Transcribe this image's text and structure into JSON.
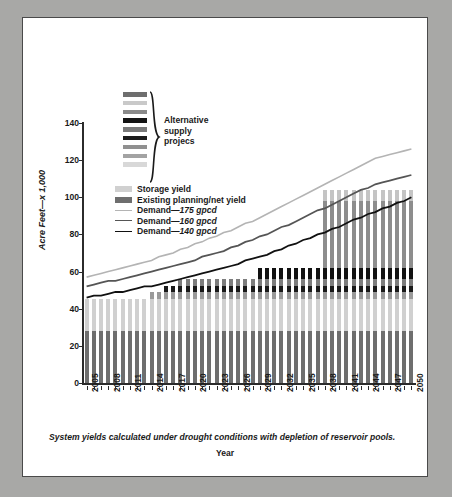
{
  "figure": {
    "label": "FIGURE 4",
    "title": "Water demand projections and alternative water supply projects",
    "footnote": "System yields calculated under drought conditions with depletion of reservoir pools."
  },
  "annotation": {
    "alt_supply_label_line1": "Alternative",
    "alt_supply_label_line2": "supply",
    "alt_supply_label_line3": "projecs",
    "swatch_colors": [
      "#6e6e6e",
      "#c9c9c9",
      "#8a8a8a",
      "#141414",
      "#7a7a7a",
      "#1c1c1c",
      "#909090",
      "#a3a3a3",
      "#d8d8d8"
    ]
  },
  "legend": {
    "position": "inside-top-left",
    "items": [
      {
        "label": "Storage yield",
        "type": "swatch",
        "color": "#d0d0d0"
      },
      {
        "label": "Existing planning/net yield",
        "type": "swatch",
        "color": "#6e6e6e"
      },
      {
        "label": "Demand—",
        "emphasis": "175 gpcd",
        "type": "line",
        "color": "#b4b4b4",
        "width": 1.6
      },
      {
        "label": "Demand—",
        "emphasis": "160 gpcd",
        "type": "line",
        "color": "#555555",
        "width": 1.8
      },
      {
        "label": "Demand—",
        "emphasis": "140 gpcd",
        "type": "line",
        "color": "#111111",
        "width": 1.8
      }
    ]
  },
  "chart_data": {
    "type": "bar",
    "stacked": true,
    "title": "Water demand projections and alternative water supply projects",
    "xlabel": "Year",
    "ylabel": "Acre Feet—x 1,000",
    "ylim": [
      0,
      140
    ],
    "yticks": [
      0,
      20,
      40,
      60,
      80,
      100,
      120,
      140
    ],
    "grid": false,
    "legend_position": "upper-left-inside",
    "x": [
      2005,
      2006,
      2007,
      2008,
      2009,
      2010,
      2011,
      2012,
      2013,
      2014,
      2015,
      2016,
      2017,
      2018,
      2019,
      2020,
      2021,
      2022,
      2023,
      2024,
      2025,
      2026,
      2027,
      2028,
      2029,
      2030,
      2031,
      2032,
      2033,
      2034,
      2035,
      2036,
      2037,
      2038,
      2039,
      2040,
      2041,
      2042,
      2043,
      2044,
      2045,
      2046,
      2047,
      2048,
      2049,
      2050
    ],
    "xtick_labels": [
      2005,
      2008,
      2011,
      2014,
      2017,
      2020,
      2023,
      2026,
      2029,
      2032,
      2035,
      2038,
      2041,
      2044,
      2047,
      2050
    ],
    "bar_series": [
      {
        "name": "Existing planning/net yield",
        "color": "#6e6e6e",
        "values": [
          28,
          28,
          28,
          28,
          28,
          28,
          28,
          28,
          28,
          28,
          28,
          28,
          28,
          28,
          28,
          28,
          28,
          28,
          28,
          28,
          28,
          28,
          28,
          28,
          28,
          28,
          28,
          28,
          28,
          28,
          28,
          28,
          28,
          28,
          28,
          28,
          28,
          28,
          28,
          28,
          28,
          28,
          28,
          28,
          28,
          28
        ]
      },
      {
        "name": "Storage yield",
        "color": "#d0d0d0",
        "values": [
          17,
          17,
          17,
          17,
          17,
          17,
          17,
          17,
          17,
          17,
          17,
          17,
          17,
          17,
          17,
          17,
          17,
          17,
          17,
          17,
          17,
          17,
          17,
          17,
          17,
          17,
          17,
          17,
          17,
          17,
          17,
          17,
          17,
          17,
          17,
          17,
          17,
          17,
          17,
          17,
          17,
          17,
          17,
          17,
          17,
          17
        ]
      },
      {
        "name": "Project A",
        "color": "#9a9a9a",
        "values": [
          0,
          0,
          0,
          0,
          0,
          0,
          0,
          0,
          0,
          4,
          4,
          4,
          4,
          4,
          4,
          4,
          4,
          4,
          4,
          4,
          4,
          4,
          4,
          4,
          4,
          4,
          4,
          4,
          4,
          4,
          4,
          4,
          4,
          4,
          4,
          4,
          4,
          4,
          4,
          4,
          4,
          4,
          4,
          4,
          4,
          4
        ]
      },
      {
        "name": "Project B",
        "color": "#1a1a1a",
        "values": [
          0,
          0,
          0,
          0,
          0,
          0,
          0,
          0,
          0,
          0,
          0,
          3,
          3,
          3,
          3,
          3,
          3,
          3,
          3,
          3,
          3,
          3,
          3,
          3,
          3,
          3,
          3,
          3,
          3,
          3,
          3,
          3,
          3,
          3,
          3,
          3,
          3,
          3,
          3,
          3,
          3,
          3,
          3,
          3,
          3,
          3
        ]
      },
      {
        "name": "Project C",
        "color": "#7d7d7d",
        "values": [
          0,
          0,
          0,
          0,
          0,
          0,
          0,
          0,
          0,
          0,
          0,
          0,
          0,
          4,
          4,
          4,
          4,
          4,
          4,
          4,
          4,
          4,
          4,
          4,
          4,
          4,
          4,
          4,
          4,
          4,
          4,
          4,
          4,
          4,
          4,
          4,
          4,
          4,
          4,
          4,
          4,
          4,
          4,
          4,
          4,
          4
        ]
      },
      {
        "name": "Project D",
        "color": "#111111",
        "values": [
          0,
          0,
          0,
          0,
          0,
          0,
          0,
          0,
          0,
          0,
          0,
          0,
          0,
          0,
          0,
          0,
          0,
          0,
          0,
          0,
          0,
          0,
          0,
          0,
          6,
          6,
          6,
          6,
          6,
          6,
          6,
          6,
          6,
          6,
          6,
          6,
          6,
          6,
          6,
          6,
          6,
          6,
          6,
          6,
          6,
          6
        ]
      },
      {
        "name": "Project E",
        "color": "#8d8d8d",
        "values": [
          0,
          0,
          0,
          0,
          0,
          0,
          0,
          0,
          0,
          0,
          0,
          0,
          0,
          0,
          0,
          0,
          0,
          0,
          0,
          0,
          0,
          0,
          0,
          0,
          0,
          0,
          0,
          0,
          0,
          0,
          0,
          0,
          0,
          36,
          36,
          36,
          36,
          36,
          36,
          36,
          36,
          36,
          36,
          36,
          36,
          36
        ]
      },
      {
        "name": "Project F",
        "color": "#c4c4c4",
        "values": [
          0,
          0,
          0,
          0,
          0,
          0,
          0,
          0,
          0,
          0,
          0,
          0,
          0,
          0,
          0,
          0,
          0,
          0,
          0,
          0,
          0,
          0,
          0,
          0,
          0,
          0,
          0,
          0,
          0,
          0,
          0,
          0,
          0,
          6,
          6,
          6,
          6,
          6,
          6,
          6,
          6,
          6,
          6,
          6,
          6,
          6
        ]
      },
      {
        "name": "Project G",
        "color": "#303030",
        "values": [
          0,
          0,
          0,
          0,
          0,
          0,
          0,
          0,
          0,
          0,
          0,
          0,
          0,
          0,
          0,
          0,
          0,
          0,
          0,
          0,
          0,
          0,
          0,
          0,
          0,
          0,
          0,
          0,
          0,
          0,
          0,
          0,
          0,
          0,
          0,
          0,
          0,
          0,
          0,
          0,
          0,
          0,
          0,
          0,
          0,
          0
        ]
      }
    ],
    "bar_totals": [
      45,
      45,
      45,
      45,
      45,
      45,
      45,
      45,
      45,
      49,
      49,
      52,
      52,
      56,
      56,
      56,
      56,
      56,
      56,
      56,
      56,
      56,
      56,
      56,
      62,
      62,
      62,
      62,
      62,
      62,
      62,
      62,
      62,
      104,
      104,
      104,
      104,
      104,
      104,
      104,
      104,
      104,
      104,
      104,
      104,
      104
    ],
    "line_series": [
      {
        "name": "Demand—175 gpcd",
        "color": "#b4b4b4",
        "width": 1.6,
        "values": [
          57,
          58,
          59,
          60,
          61,
          62,
          63,
          64,
          65,
          66,
          68,
          69,
          70,
          72,
          73,
          75,
          76,
          78,
          79,
          81,
          82,
          84,
          86,
          87,
          89,
          91,
          93,
          95,
          97,
          99,
          101,
          103,
          105,
          107,
          109,
          111,
          113,
          115,
          117,
          119,
          121,
          122,
          123,
          124,
          125,
          126
        ]
      },
      {
        "name": "Demand—160 gpcd",
        "color": "#555555",
        "width": 1.8,
        "values": [
          52,
          53,
          54,
          55,
          55,
          56,
          57,
          58,
          59,
          60,
          61,
          62,
          63,
          64,
          65,
          66,
          68,
          69,
          70,
          71,
          73,
          74,
          76,
          77,
          79,
          80,
          82,
          84,
          85,
          87,
          89,
          91,
          93,
          94,
          96,
          98,
          100,
          102,
          104,
          105,
          107,
          108,
          109,
          110,
          111,
          112
        ]
      },
      {
        "name": "Demand—140 gpcd",
        "color": "#111111",
        "width": 1.8,
        "values": [
          46,
          47,
          47,
          48,
          49,
          49,
          50,
          51,
          52,
          52,
          53,
          54,
          55,
          56,
          57,
          58,
          59,
          60,
          61,
          62,
          63,
          64,
          66,
          67,
          68,
          69,
          71,
          72,
          74,
          75,
          77,
          78,
          80,
          81,
          83,
          84,
          86,
          88,
          89,
          91,
          92,
          94,
          95,
          97,
          98,
          100
        ]
      }
    ]
  }
}
